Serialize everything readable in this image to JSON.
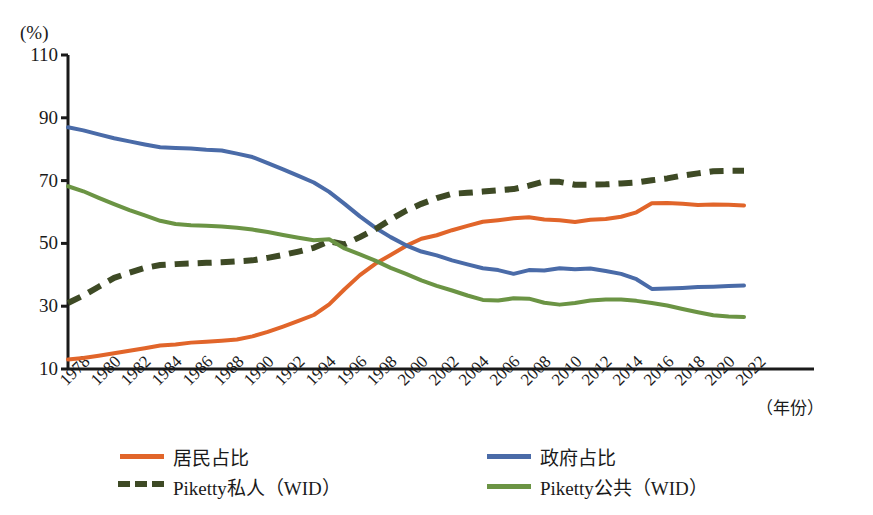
{
  "chart_data": {
    "type": "line",
    "title": "",
    "xlabel": "（年份）",
    "ylabel": "(%)",
    "ylim": [
      10,
      110
    ],
    "yticks": [
      10,
      30,
      50,
      70,
      90,
      110
    ],
    "xlim": [
      1978,
      2022
    ],
    "xticks": [
      1978,
      1980,
      1982,
      1984,
      1986,
      1988,
      1990,
      1992,
      1994,
      1996,
      1998,
      2000,
      2002,
      2004,
      2006,
      2008,
      2010,
      2012,
      2014,
      2016,
      2018,
      2020,
      2022
    ],
    "grid": false,
    "legend_position": "bottom",
    "x": [
      1978,
      1979,
      1980,
      1981,
      1982,
      1983,
      1984,
      1985,
      1986,
      1987,
      1988,
      1989,
      1990,
      1991,
      1992,
      1993,
      1994,
      1995,
      1996,
      1997,
      1998,
      1999,
      2000,
      2001,
      2002,
      2003,
      2004,
      2005,
      2006,
      2007,
      2008,
      2009,
      2010,
      2011,
      2012,
      2013,
      2014,
      2015,
      2016,
      2017,
      2018,
      2019,
      2020,
      2021,
      2022
    ],
    "series": [
      {
        "name": "居民占比",
        "color": "#E1652A",
        "style": "solid",
        "values": [
          13,
          13.5,
          14.2,
          15,
          15.8,
          16.6,
          17.5,
          17.8,
          18.4,
          18.7,
          19,
          19.4,
          20.4,
          21.8,
          23.5,
          25.3,
          27.2,
          30.6,
          35.4,
          39.9,
          43.5,
          46.3,
          49.2,
          51.5,
          52.6,
          54.2,
          55.6,
          56.9,
          57.4,
          58,
          58.3,
          57.6,
          57.4,
          56.8,
          57.5,
          57.8,
          58.5,
          59.9,
          62.8,
          62.9,
          62.6,
          62.2,
          62.4,
          62.3,
          62.1
        ]
      },
      {
        "name": "政府占比",
        "color": "#4A6BA8",
        "style": "solid",
        "values": [
          87,
          86,
          84.7,
          83.5,
          82.5,
          81.5,
          80.6,
          80.4,
          80.2,
          79.8,
          79.6,
          78.6,
          77.5,
          75.6,
          73.6,
          71.5,
          69.4,
          66.4,
          62.6,
          58.6,
          55,
          52,
          49.4,
          47.4,
          46.2,
          44.6,
          43.3,
          42.1,
          41.5,
          40.3,
          41.5,
          41.4,
          42.1,
          41.8,
          42,
          41.2,
          40.3,
          38.6,
          35.5,
          35.6,
          35.8,
          36.1,
          36.2,
          36.4,
          36.6
        ]
      },
      {
        "name": "Piketty私人（WID）",
        "color": "#3E4A25",
        "style": "dashed",
        "values": [
          31,
          33.4,
          36.2,
          39,
          40.7,
          42.2,
          43.1,
          43.4,
          43.6,
          43.8,
          44,
          44.3,
          44.6,
          45.4,
          46.3,
          47.4,
          48.6,
          50.7,
          49.7,
          52,
          54.5,
          57.6,
          60.4,
          62.6,
          64.4,
          65.8,
          66.1,
          66.5,
          66.9,
          67.3,
          68.4,
          69.7,
          69.6,
          68.7,
          68.7,
          68.8,
          69.1,
          69.4,
          70.1,
          70.7,
          71.6,
          72.3,
          73,
          73.1,
          73.1
        ]
      },
      {
        "name": "Piketty公共（WID）",
        "color": "#6B9444",
        "style": "solid",
        "values": [
          68.2,
          66.6,
          64.5,
          62.5,
          60.6,
          58.9,
          57.2,
          56.2,
          55.8,
          55.6,
          55.4,
          55,
          54.4,
          53.6,
          52.7,
          51.8,
          51,
          51.3,
          48.4,
          46.5,
          44.5,
          42.2,
          40.3,
          38.2,
          36.5,
          35,
          33.4,
          32,
          31.8,
          32.5,
          32.4,
          31.1,
          30.5,
          31,
          31.8,
          32.1,
          32.1,
          31.7,
          31,
          30.2,
          29.1,
          28.1,
          27.1,
          26.7,
          26.6
        ]
      }
    ]
  },
  "axis": {
    "unit_label": "(%)",
    "x_title": "（年份）",
    "y_tick_labels": [
      "110",
      "90",
      "70",
      "50",
      "30",
      "10"
    ],
    "x_tick_labels": [
      "1978",
      "1980",
      "1982",
      "1984",
      "1986",
      "1988",
      "1990",
      "1992",
      "1994",
      "1996",
      "1998",
      "2000",
      "2002",
      "2004",
      "2006",
      "2008",
      "2010",
      "2012",
      "2014",
      "2016",
      "2018",
      "2020",
      "2022"
    ]
  },
  "legend": {
    "items": [
      {
        "label": "居民占比",
        "color": "#E1652A",
        "style": "solid"
      },
      {
        "label": "政府占比",
        "color": "#4A6BA8",
        "style": "solid"
      },
      {
        "label": "Piketty私人（WID）",
        "color": "#3E4A25",
        "style": "dashed"
      },
      {
        "label": "Piketty公共（WID）",
        "color": "#6B9444",
        "style": "solid"
      }
    ]
  },
  "colors": {
    "residents": "#E1652A",
    "government": "#4A6BA8",
    "piketty_private": "#3E4A25",
    "piketty_public": "#6B9444",
    "axis": "#1a1a1a"
  }
}
